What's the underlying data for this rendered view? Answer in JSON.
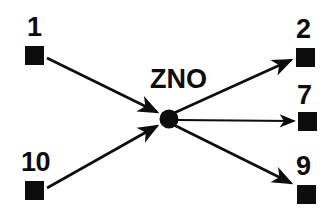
{
  "diagram": {
    "background_color": "#ffffff",
    "ink_color": "#0d0d0d",
    "center_node": {
      "id": "center",
      "label": "ZNO",
      "shape": "filled-circle",
      "x": 169,
      "y": 118,
      "radius": 9,
      "label_x": 150,
      "label_y": 66
    },
    "nodes": [
      {
        "id": "n1",
        "label": "1",
        "shape": "filled-square",
        "x": 25,
        "y": 46,
        "size": 19,
        "label_x": 27,
        "label_y": 14,
        "role": "source"
      },
      {
        "id": "n10",
        "label": "10",
        "shape": "filled-square",
        "x": 25,
        "y": 181,
        "size": 19,
        "label_x": 21,
        "label_y": 149,
        "role": "source"
      },
      {
        "id": "n2",
        "label": "2",
        "shape": "filled-square",
        "x": 296,
        "y": 48,
        "size": 19,
        "label_x": 296,
        "label_y": 16,
        "role": "target"
      },
      {
        "id": "n7",
        "label": "7",
        "shape": "filled-square",
        "x": 298,
        "y": 112,
        "size": 19,
        "label_x": 297,
        "label_y": 82,
        "role": "target"
      },
      {
        "id": "n9",
        "label": "9",
        "shape": "filled-square",
        "x": 297,
        "y": 185,
        "size": 19,
        "label_x": 296,
        "label_y": 153,
        "role": "target"
      }
    ],
    "edges": [
      {
        "id": "e1",
        "from": "n1",
        "to": "center",
        "direction": "in",
        "x1": 47,
        "y1": 58,
        "x2": 161,
        "y2": 114
      },
      {
        "id": "e2",
        "from": "n10",
        "to": "center",
        "direction": "in",
        "x1": 47,
        "y1": 188,
        "x2": 161,
        "y2": 124
      },
      {
        "id": "e3",
        "from": "center",
        "to": "n2",
        "direction": "out",
        "x1": 176,
        "y1": 114,
        "x2": 294,
        "y2": 60
      },
      {
        "id": "e4",
        "from": "center",
        "to": "n7",
        "direction": "out",
        "x1": 178,
        "y1": 120,
        "x2": 296,
        "y2": 121
      },
      {
        "id": "e5",
        "from": "center",
        "to": "n9",
        "direction": "out",
        "x1": 176,
        "y1": 124,
        "x2": 294,
        "y2": 184
      }
    ]
  }
}
